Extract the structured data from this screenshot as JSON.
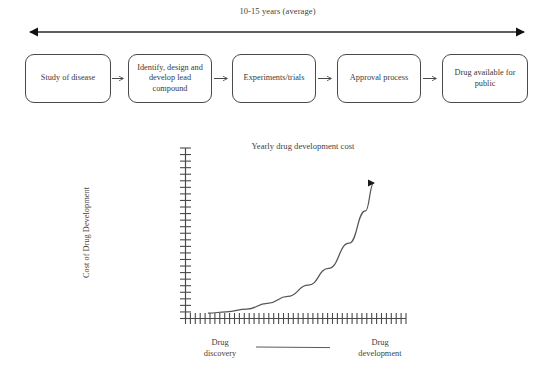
{
  "timeline": {
    "label": "10-15 years (average)",
    "arrow": "double-headed-arrow"
  },
  "process_steps": [
    {
      "label": "Study of disease"
    },
    {
      "label": "Identify, design and develop lead compound"
    },
    {
      "label": "Experiments/trials"
    },
    {
      "label": "Approval process"
    },
    {
      "label": "Drug available for public"
    }
  ],
  "chart_data": {
    "type": "line",
    "title": "Yearly drug development cost",
    "xlabel": "",
    "ylabel": "Cost of Drug Development",
    "grid": false,
    "legend": null,
    "axis_ticks": {
      "x_count": 45,
      "y_count": 26,
      "tick_labels": []
    },
    "xlim": [
      0,
      100
    ],
    "ylim": [
      0,
      100
    ],
    "annotations": [
      "Drug discovery",
      "Drug development"
    ],
    "series": [
      {
        "name": "Cost of drug development",
        "shape": "exponential-rising",
        "arrow_head": true,
        "x": [
          11,
          20,
          30,
          40,
          50,
          60,
          70,
          80,
          88,
          92
        ],
        "y": [
          2,
          3,
          5,
          9,
          14,
          22,
          34,
          52,
          75,
          95
        ]
      }
    ]
  },
  "footer": {
    "left_label_line1": "Drug",
    "left_label_line2": "discovery",
    "right_label_line1": "Drug",
    "right_label_line2": "development",
    "connector": "horizontal-line"
  },
  "colors": {
    "stroke": "#4a4a4a",
    "text": "#3a3a3a",
    "background": "#ffffff",
    "curve": "#555555"
  }
}
